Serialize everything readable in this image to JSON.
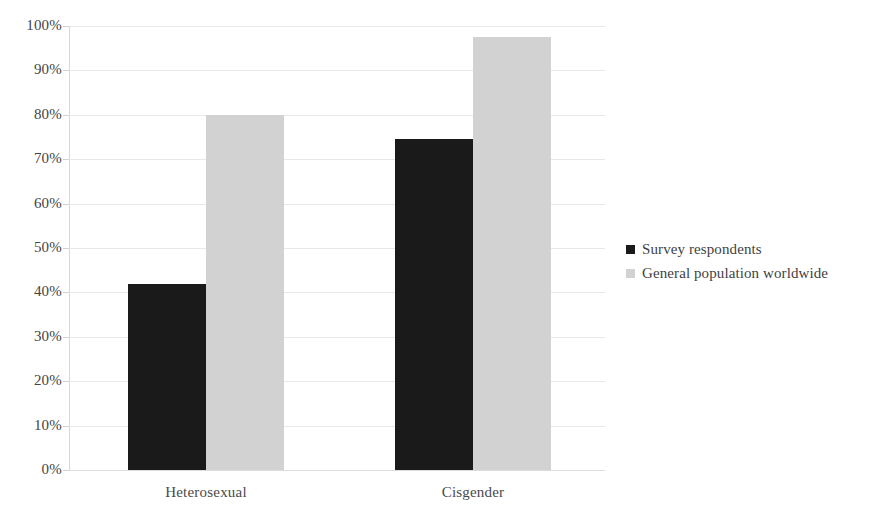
{
  "chart_data": {
    "type": "bar",
    "title": "",
    "subtitle": "",
    "xlabel": "",
    "ylabel": "",
    "categories": [
      "Heterosexual",
      "Cisgender"
    ],
    "series": [
      {
        "name": "Survey respondents",
        "color": "#1a1a1a",
        "values": [
          42,
          74.5
        ]
      },
      {
        "name": "General population worldwide",
        "color": "#d2d2d2",
        "values": [
          80,
          97.5
        ]
      }
    ],
    "ylim": [
      0,
      100
    ],
    "ytick_step": 10,
    "ytick_labels": [
      "100%",
      "90%",
      "80%",
      "70%",
      "60%",
      "50%",
      "40%",
      "30%",
      "20%",
      "10%",
      "0%"
    ],
    "ytick_values": [
      100,
      90,
      80,
      70,
      60,
      50,
      40,
      30,
      20,
      10,
      0
    ],
    "value_format": "percent",
    "grid": true,
    "grid_axis": "y",
    "legend_position": "right",
    "background": "#ffffff",
    "grid_color": "#e8e8e8",
    "axis_color": "#d8d8d8"
  },
  "legend": {
    "items": [
      {
        "label": "Survey respondents"
      },
      {
        "label": "General population worldwide"
      }
    ]
  },
  "axes": {
    "y": {
      "ticks": [
        {
          "label": "100%"
        },
        {
          "label": "90%"
        },
        {
          "label": "80%"
        },
        {
          "label": "70%"
        },
        {
          "label": "60%"
        },
        {
          "label": "50%"
        },
        {
          "label": "40%"
        },
        {
          "label": "30%"
        },
        {
          "label": "20%"
        },
        {
          "label": "10%"
        },
        {
          "label": "0%"
        }
      ]
    },
    "x": {
      "ticks": [
        {
          "label": "Heterosexual"
        },
        {
          "label": "Cisgender"
        }
      ]
    }
  }
}
